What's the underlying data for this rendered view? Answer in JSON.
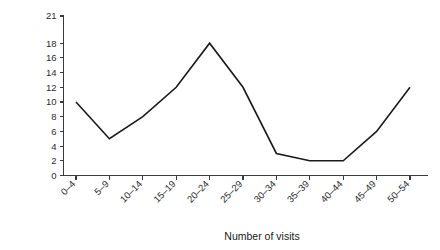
{
  "chart_data": {
    "type": "line",
    "title": "",
    "subtitle": "",
    "xlabel": "Number of visits",
    "ylabel": "Frequency",
    "categories": [
      "0–4",
      "5–9",
      "10–14",
      "15–19",
      "20–24",
      "25–29",
      "30–34",
      "35–39",
      "40–44",
      "45–49",
      "50–54"
    ],
    "values": [
      10,
      5,
      8,
      12,
      18,
      12,
      3,
      2,
      2,
      6,
      12
    ],
    "series": [
      {
        "name": "Frequency",
        "values": [
          10,
          5,
          8,
          12,
          18,
          12,
          3,
          2,
          2,
          6,
          12
        ]
      }
    ],
    "yticks": [
      0,
      2,
      4,
      6,
      8,
      10,
      12,
      14,
      16,
      18,
      21
    ],
    "ytick_labels": [
      "0",
      "2",
      "4",
      "6",
      "8",
      "10",
      "12",
      "14",
      "16",
      "18",
      "21"
    ],
    "ylim": [
      0,
      21
    ],
    "grid": false,
    "legend": false,
    "legend_position": "none",
    "line_color": "#1a1a1a",
    "axis_color": "#3a3a3a",
    "background_color": "#ffffff",
    "xtick_label_rotation": 45
  }
}
